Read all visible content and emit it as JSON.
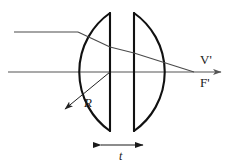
{
  "figure": {
    "background_color": "#ffffff",
    "stroke_color": "#1a1a1a",
    "lens_stroke_color": "#111111",
    "ray_stroke_color": "#444444",
    "axis_stroke_color": "#555555"
  },
  "labels": {
    "radius": "R",
    "thickness": "t",
    "rear_vertex": "V'",
    "rear_focal_point": "F'"
  },
  "geometry": {
    "axis_y": 72,
    "circle_center_x": 122,
    "circle_center_y": 72,
    "circle_radius": 72,
    "left_face_x": 110,
    "right_face_x": 134,
    "left_vertex_x": 50,
    "right_vertex_x": 194,
    "face_top_y": 13,
    "face_bottom_y": 131,
    "thickness_t": 24,
    "radius_label_x": 84,
    "radius_label_y": 104,
    "thickness_label_x": 122,
    "thickness_label_y": 155
  },
  "rays": {
    "incoming": {
      "name": "parallel-incoming-ray",
      "start_x": 14,
      "start_y": 32,
      "end_x": 78,
      "end_y": 32
    },
    "inside_first_half": {
      "name": "refracted-ray-inside-first-half",
      "start_x": 78,
      "start_y": 32,
      "end_x": 110,
      "end_y": 47
    },
    "inside_gap": {
      "name": "refracted-ray-across-gap",
      "start_x": 110,
      "start_y": 47,
      "end_x": 134,
      "end_y": 53
    },
    "inside_second_half": {
      "name": "refracted-ray-inside-second-half",
      "start_x": 134,
      "start_y": 53,
      "end_x": 194,
      "end_y": 72
    }
  },
  "axis": {
    "name": "optical-axis",
    "start_x": 8,
    "end_x": 224,
    "y": 72,
    "arrow": true
  },
  "radius_arrow": {
    "name": "radius-arrow",
    "from_x": 110,
    "from_y": 72,
    "to_x": 64,
    "to_y": 110
  },
  "thickness_arrow": {
    "name": "thickness-dimension-arrow",
    "left_x": 101,
    "right_x": 143,
    "y": 145
  }
}
